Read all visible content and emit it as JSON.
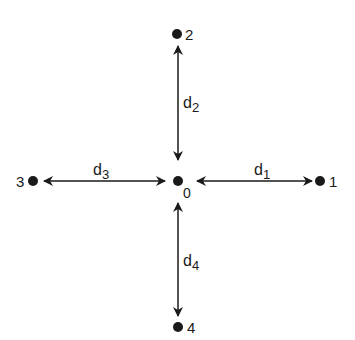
{
  "diagram": {
    "nodes": [
      {
        "id": "0",
        "label": "0",
        "x": 178,
        "y": 181
      },
      {
        "id": "1",
        "label": "1",
        "x": 320,
        "y": 181
      },
      {
        "id": "2",
        "label": "2",
        "x": 177,
        "y": 34
      },
      {
        "id": "3",
        "label": "3",
        "x": 33,
        "y": 181
      },
      {
        "id": "4",
        "label": "4",
        "x": 178,
        "y": 327
      }
    ],
    "edges": [
      {
        "from": "0",
        "to": "1",
        "label": "d",
        "subscript": "1",
        "bidirectional": true
      },
      {
        "from": "0",
        "to": "2",
        "label": "d",
        "subscript": "2",
        "bidirectional": true
      },
      {
        "from": "0",
        "to": "3",
        "label": "d",
        "subscript": "3",
        "bidirectional": true
      },
      {
        "from": "0",
        "to": "4",
        "label": "d",
        "subscript": "4",
        "bidirectional": true
      }
    ],
    "colors": {
      "ink": "#1a1a1a",
      "background": "#ffffff"
    }
  }
}
